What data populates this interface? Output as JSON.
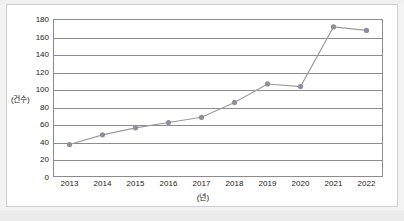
{
  "document": {
    "kind": "scanned-chart-figure",
    "background_color": "#f3f3f3",
    "card_color": "#ffffff"
  },
  "chart_data": {
    "type": "line",
    "title": "",
    "subtitle": "",
    "xlabel": "(년)",
    "ylabel": "(건수)",
    "categories": [
      "2013",
      "2014",
      "2015",
      "2016",
      "2017",
      "2018",
      "2019",
      "2020",
      "2021",
      "2022"
    ],
    "values": [
      37,
      48,
      56,
      62,
      68,
      85,
      106,
      103,
      171,
      167
    ],
    "series": [
      {
        "name": "건수",
        "values": [
          37,
          48,
          56,
          62,
          68,
          85,
          106,
          103,
          171,
          167
        ]
      }
    ],
    "ylim": [
      0,
      180
    ],
    "ytick_labels": [
      "0",
      "20",
      "40",
      "60",
      "80",
      "100",
      "120",
      "140",
      "160",
      "180"
    ],
    "ytick_values": [
      0,
      20,
      40,
      60,
      80,
      100,
      120,
      140,
      160,
      180
    ],
    "xtick_labels": [
      "2013",
      "2014",
      "2015",
      "2016",
      "2017",
      "2018",
      "2019",
      "2020",
      "2021",
      "2022"
    ],
    "grid": "horizontal",
    "legend": "none",
    "legend_position": "none",
    "marker": "circle",
    "line_color": "#9a9a9a",
    "marker_color": "#8b8f9e",
    "axis_color": "#8c8c8c",
    "gridline_color": "#8c8c8c",
    "annotations": []
  }
}
